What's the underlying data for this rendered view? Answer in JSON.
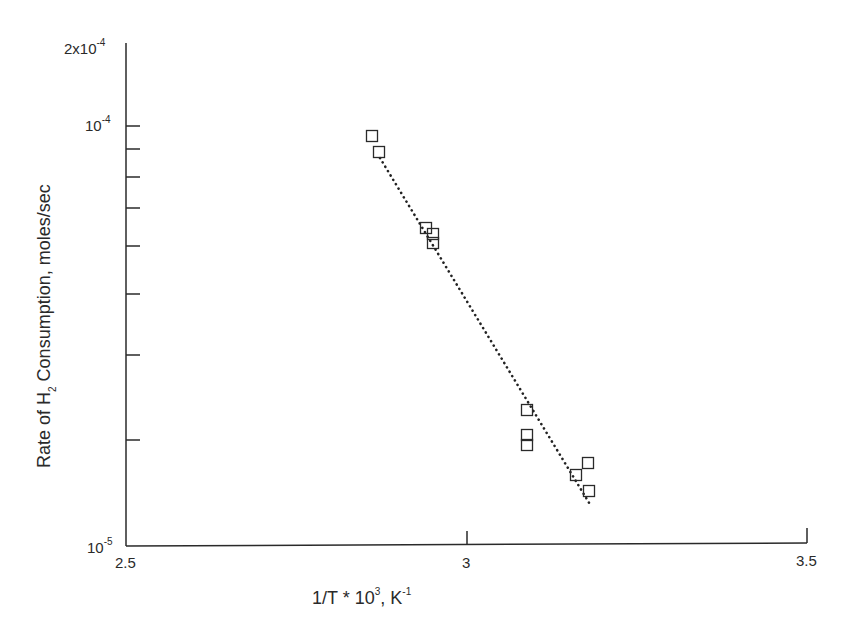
{
  "chart_data": {
    "type": "scatter",
    "title": "",
    "xlabel": "1/T * 10^3, K^-1",
    "ylabel": "Rate of H2 Consumption, moles/sec",
    "xlim": [
      2.5,
      3.5
    ],
    "ylim": [
      1e-05,
      0.0002
    ],
    "yscale": "log",
    "grid": false,
    "legend": null,
    "x_ticks": [
      "2.5",
      "3",
      "3.5"
    ],
    "y_ticks": [
      "10^-5",
      "10^-4",
      "2x10^-4"
    ],
    "series": [
      {
        "name": "measured",
        "marker": "open-square",
        "points": [
          {
            "x": 2.861,
            "y": 9.5e-05
          },
          {
            "x": 2.871,
            "y": 8.8e-05
          },
          {
            "x": 2.94,
            "y": 5.9e-05
          },
          {
            "x": 2.95,
            "y": 5.75e-05
          },
          {
            "x": 2.95,
            "y": 5.4e-05
          },
          {
            "x": 3.088,
            "y": 2.3e-05
          },
          {
            "x": 3.088,
            "y": 2e-05
          },
          {
            "x": 3.088,
            "y": 1.95e-05
          },
          {
            "x": 3.16,
            "y": 1.7e-05
          },
          {
            "x": 3.177,
            "y": 1.8e-05
          },
          {
            "x": 3.178,
            "y": 1.55e-05
          }
        ]
      },
      {
        "name": "fit",
        "line": "dotted",
        "points": [
          {
            "x": 2.872,
            "y": 8.6e-05
          },
          {
            "x": 3.18,
            "y": 1.45e-05
          }
        ]
      }
    ]
  },
  "axes": {
    "y_label_main": "Rate of H",
    "y_label_sub": "2",
    "y_label_rest": " Consumption, moles/sec",
    "x_label_main": "1/T * 10",
    "x_label_sup": "3",
    "x_label_mid": ", K",
    "x_label_sup2": "-1",
    "y_tick_top_base": "2x10",
    "y_tick_top_exp": "-4",
    "y_tick_mid_base": "10",
    "y_tick_mid_exp": "-4",
    "y_tick_bot_base": "10",
    "y_tick_bot_exp": "-5",
    "x_tick_1": "2.5",
    "x_tick_2": "3",
    "x_tick_3": "3.5"
  },
  "pixel_points": [
    [
      372,
      136
    ],
    [
      379,
      152
    ],
    [
      426,
      228
    ],
    [
      433,
      234
    ],
    [
      433,
      243
    ],
    [
      527,
      410
    ],
    [
      527,
      435
    ],
    [
      527,
      445
    ],
    [
      576,
      475
    ],
    [
      588,
      463
    ],
    [
      589,
      491
    ]
  ],
  "minor_ticks_y": [
    149,
    177,
    208,
    246,
    294,
    355,
    440
  ]
}
